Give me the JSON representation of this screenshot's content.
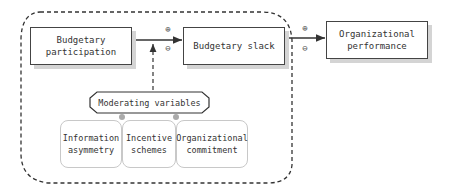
{
  "diagram": {
    "nodes": {
      "budgetary_participation": {
        "label_line1": "Budgetary",
        "label_line2": "participation"
      },
      "budgetary_slack": {
        "label": "Budgetary slack"
      },
      "organizational_performance": {
        "label_line1": "Organizational",
        "label_line2": "performance"
      },
      "moderating_variables": {
        "label": "Moderating variables"
      },
      "moderators": [
        {
          "label_line1": "Information",
          "label_line2": "asymmetry"
        },
        {
          "label_line1": "Incentive",
          "label_line2": "schemes"
        },
        {
          "label_line1": "Organizational",
          "label_line2": "commitment"
        }
      ]
    },
    "edges": [
      {
        "from": "Budgetary participation",
        "to": "Budgetary slack",
        "signs": [
          "+",
          "-"
        ]
      },
      {
        "from": "Budgetary slack",
        "to": "Organizational performance",
        "signs": [
          "+",
          "-"
        ]
      },
      {
        "from": "Moderating variables",
        "to": "Budgetary participation → Budgetary slack",
        "style": "dashed"
      }
    ],
    "signs": {
      "plus": "⊕",
      "minus": "⊖"
    },
    "colors": {
      "border": "#444444",
      "shadow": "#d4d4d4",
      "dashed_frame": "#333333",
      "moderator_border": "#c8c8c8"
    }
  }
}
